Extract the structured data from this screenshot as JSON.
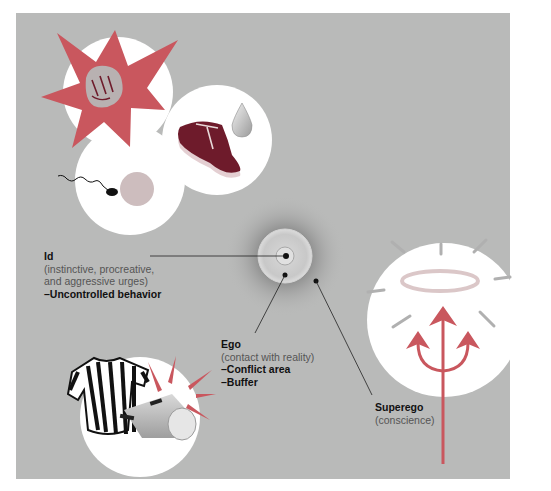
{
  "diagram": {
    "colors": {
      "background_panel": "#b9bab9",
      "accent_red": "#c9575e",
      "meat": "#6e1b2b",
      "white": "#ffffff"
    },
    "labels": {
      "id": {
        "title": "Id",
        "description_line1": "(instinctive, procreative,",
        "description_line2": "and aggressive urges)",
        "point": "–Uncontrolled behavior"
      },
      "ego": {
        "title": "Ego",
        "description": "(contact with reality)",
        "point1": "–Conflict area",
        "point2": "–Buffer"
      },
      "superego": {
        "title": "Superego",
        "description": "(conscience)"
      }
    },
    "illustrations": {
      "id_icons": [
        "fist-starburst-icon",
        "steak-icon",
        "water-drop-icon",
        "sperm-egg-icon"
      ],
      "ego_icons": [
        "referee-shirt-icon",
        "whistle-icon"
      ],
      "superego_icons": [
        "halo-icon",
        "pitchfork-icon"
      ],
      "center": "concentric-target"
    }
  }
}
